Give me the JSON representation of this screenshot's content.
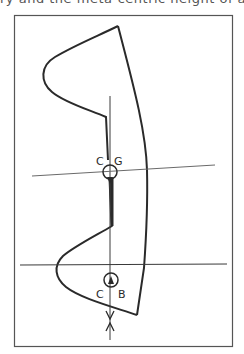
{
  "caption": {
    "text": "ry and the meta-centric height of a yacht"
  },
  "figure": {
    "points": {
      "center_of_gravity": {
        "label_left": "C",
        "label_right": "G"
      },
      "center_of_buoyancy": {
        "label_left": "C",
        "label_right": "B"
      }
    },
    "lines": {
      "heeled_waterline": "thin inclined line through CG",
      "upright_waterline": "horizontal line above CB",
      "vertical_axis": "vertical line through CG and CB with opposing arrowheads"
    },
    "colors": {
      "stroke": "#2a2a2a",
      "frame": "#555555",
      "thin_line": "#6a6a6a",
      "background": "#ffffff"
    }
  }
}
